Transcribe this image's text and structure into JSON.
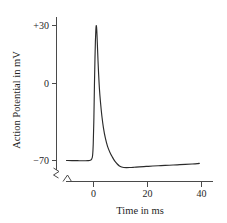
{
  "chart_data": {
    "type": "line",
    "title": "",
    "xlabel": "Time in ms",
    "ylabel": "Action Potential in mV",
    "xlim": [
      -11,
      42
    ],
    "ylim": [
      -80,
      38
    ],
    "xticks": [
      0,
      20,
      40
    ],
    "xtick_labels": [
      "0",
      "20",
      "40"
    ],
    "yticks": [
      30,
      0,
      -70
    ],
    "ytick_labels": [
      "+30",
      "0",
      "−70"
    ],
    "grid": false,
    "legend": null,
    "axis_break_x": true,
    "axis_break_y": true,
    "series": [
      {
        "name": "Action potential",
        "x": [
          -10.0,
          -8.0,
          -6.0,
          -4.5,
          -3.0,
          -2.0,
          -1.2,
          -0.7,
          -0.35,
          -0.1,
          0.15,
          0.35,
          0.55,
          0.7,
          0.85,
          0.95,
          1.05,
          1.15,
          1.3,
          1.45,
          1.65,
          1.9,
          2.2,
          2.6,
          3.1,
          3.7,
          4.4,
          5.2,
          6.1,
          7.0,
          7.9,
          8.8,
          9.6,
          10.4,
          11.2,
          12.2,
          13.5,
          15.0,
          17.0,
          19.5,
          22.0,
          25.0,
          28.0,
          31.0,
          34.0,
          36.5,
          38.5,
          39.2
        ],
        "y": [
          -70.0,
          -70.1,
          -70.1,
          -70.2,
          -70.2,
          -70.1,
          -69.8,
          -69.0,
          -66.5,
          -58.0,
          -38.0,
          -14.0,
          6.0,
          18.0,
          26.0,
          29.0,
          30.0,
          28.5,
          23.0,
          15.0,
          5.0,
          -6.0,
          -17.0,
          -27.0,
          -37.0,
          -46.0,
          -53.5,
          -59.5,
          -64.0,
          -67.5,
          -70.5,
          -72.6,
          -74.0,
          -74.8,
          -75.2,
          -75.3,
          -75.2,
          -75.0,
          -74.7,
          -74.4,
          -74.1,
          -73.8,
          -73.5,
          -73.2,
          -72.9,
          -72.6,
          -72.3,
          -72.1
        ]
      }
    ],
    "annotations": {
      "resting_potential_mV": -70,
      "peak_potential_mV": 30,
      "undershoot_min_mV": -75.3
    },
    "colors": {
      "curve": "#2b2b2b",
      "axis": "#4a4a4a",
      "text": "#1f1f1f",
      "background": "#ffffff"
    }
  }
}
